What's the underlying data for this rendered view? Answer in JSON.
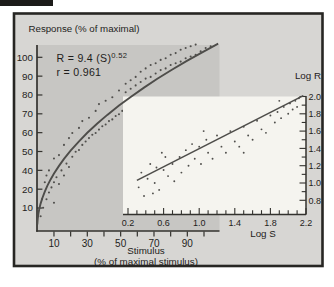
{
  "figure": {
    "title": "Response (% of maximal)",
    "equation_base": "R = 9.4 (S)",
    "equation_exponent": "0.52",
    "correlation": "r = 0.961",
    "xlabel_line1": "Stimulus",
    "xlabel_line2": "(% of maximal stimulus)",
    "inset_xlabel": "Log S",
    "inset_ylabel": "Log R"
  },
  "colors": {
    "page": "#ffffff",
    "frame_fill": "#d7d6d3",
    "frame_stroke": "#272623",
    "plot_area": "#c7c6c3",
    "inset_fill": "#f5f4ef",
    "curve": "#4e4d4a",
    "dot": "#504f4c",
    "axis": "#33322e",
    "text": "#1e1d1b"
  },
  "chart_data": [
    {
      "type": "scatter",
      "name": "main",
      "title": "Response (% of maximal) vs Stimulus (% of maximal stimulus)",
      "xlabel": "Stimulus (% of maximal stimulus)",
      "ylabel": "Response (% of maximal)",
      "xlim": [
        0,
        109
      ],
      "ylim": [
        0,
        109
      ],
      "x_ticks": [
        10,
        20,
        30,
        40,
        50,
        60,
        70,
        80,
        90,
        100
      ],
      "x_tick_labels": [
        "10",
        "30",
        "50",
        "70",
        "90"
      ],
      "x_labeled_values": [
        10,
        30,
        50,
        70,
        90
      ],
      "y_tick_labels": [
        "100",
        "90",
        "80",
        "70",
        "60",
        "50",
        "40",
        "20",
        "10"
      ],
      "grid": false,
      "fit": {
        "type": "power",
        "equation": "R = 9.4 (S)^0.52",
        "a": 9.4,
        "b": 0.52,
        "r": 0.961,
        "s_range": [
          0.02,
          108.5
        ]
      },
      "points": [
        [
          2,
          6
        ],
        [
          2.8,
          16
        ],
        [
          3.5,
          11
        ],
        [
          4.5,
          26
        ],
        [
          5.5,
          16
        ],
        [
          5.5,
          30
        ],
        [
          7,
          20
        ],
        [
          7,
          33
        ],
        [
          8.5,
          23
        ],
        [
          10,
          26
        ],
        [
          10,
          40
        ],
        [
          10,
          14
        ],
        [
          11.5,
          29
        ],
        [
          13,
          42
        ],
        [
          13,
          25
        ],
        [
          14.5,
          33
        ],
        [
          16,
          48
        ],
        [
          16,
          30
        ],
        [
          17.5,
          37
        ],
        [
          19,
          52
        ],
        [
          19,
          35
        ],
        [
          21,
          41
        ],
        [
          21,
          55
        ],
        [
          23,
          44
        ],
        [
          25,
          58
        ],
        [
          25,
          45
        ],
        [
          27,
          48
        ],
        [
          27,
          62
        ],
        [
          29,
          50
        ],
        [
          31,
          64
        ],
        [
          31,
          52
        ],
        [
          33,
          54
        ],
        [
          35,
          68
        ],
        [
          35,
          55
        ],
        [
          37,
          57
        ],
        [
          37,
          72
        ],
        [
          39,
          59
        ],
        [
          41,
          74
        ],
        [
          41,
          60
        ],
        [
          43,
          62
        ],
        [
          45,
          76
        ],
        [
          45,
          63
        ],
        [
          47,
          65
        ],
        [
          49,
          80
        ],
        [
          49,
          66
        ],
        [
          51,
          68
        ],
        [
          53,
          84
        ],
        [
          53,
          79
        ],
        [
          56,
          86
        ],
        [
          56,
          81
        ],
        [
          59,
          88
        ],
        [
          59,
          83
        ],
        [
          62,
          91
        ],
        [
          62,
          85
        ],
        [
          65,
          93
        ],
        [
          65,
          87
        ],
        [
          68,
          95
        ],
        [
          68,
          88
        ],
        [
          71,
          96
        ],
        [
          71,
          90
        ],
        [
          74,
          98
        ],
        [
          74,
          92
        ],
        [
          77,
          99
        ],
        [
          77,
          93
        ],
        [
          80,
          101
        ],
        [
          80,
          95
        ],
        [
          83,
          102
        ],
        [
          83,
          96
        ],
        [
          86,
          104
        ],
        [
          86,
          97
        ],
        [
          89,
          105
        ],
        [
          89,
          99
        ],
        [
          92,
          106
        ],
        [
          92,
          100
        ],
        [
          95,
          107
        ],
        [
          95,
          101
        ],
        [
          98,
          103
        ],
        [
          101,
          105
        ],
        [
          104,
          106
        ]
      ]
    },
    {
      "type": "scatter",
      "name": "inset",
      "title": "Log R vs Log S",
      "xlabel": "Log S",
      "ylabel": "Log R",
      "xlim": [
        0.2,
        2.2
      ],
      "ylim": [
        0.8,
        2.0
      ],
      "x_tick_labels": [
        "0.2",
        "0.6",
        "1.0",
        "1.4",
        "1.8",
        "2.2"
      ],
      "x_labeled_values": [
        0.2,
        0.6,
        1.0,
        1.4,
        1.8,
        2.2
      ],
      "x_minor_step": 0.1,
      "y_tick_labels": [
        "2.0",
        "1.8",
        "1.6",
        "1.4",
        "1.2",
        "1.0",
        "0.8"
      ],
      "y_labeled_values": [
        2.0,
        1.8,
        1.6,
        1.4,
        1.2,
        1.0,
        0.8
      ],
      "y_minor_step": 0.1,
      "grid": false,
      "line": [
        [
          0.3,
          1.03
        ],
        [
          2.17,
          2.01
        ]
      ],
      "points": [
        [
          0.32,
          0.95
        ],
        [
          0.35,
          1.12
        ],
        [
          0.38,
          0.85
        ],
        [
          0.42,
          1.05
        ],
        [
          0.45,
          1.22
        ],
        [
          0.48,
          0.88
        ],
        [
          0.5,
          1.0
        ],
        [
          0.52,
          1.18
        ],
        [
          0.55,
          0.92
        ],
        [
          0.58,
          1.35
        ],
        [
          0.6,
          1.15
        ],
        [
          0.62,
          1.3
        ],
        [
          0.65,
          1.08
        ],
        [
          0.7,
          1.22
        ],
        [
          0.72,
          1.02
        ],
        [
          0.78,
          1.3
        ],
        [
          0.8,
          1.12
        ],
        [
          0.85,
          1.38
        ],
        [
          0.88,
          1.2
        ],
        [
          0.92,
          1.45
        ],
        [
          0.95,
          1.28
        ],
        [
          1.0,
          1.42
        ],
        [
          1.02,
          1.22
        ],
        [
          1.05,
          1.6
        ],
        [
          1.08,
          1.5
        ],
        [
          1.1,
          1.35
        ],
        [
          1.15,
          1.28
        ],
        [
          1.2,
          1.55
        ],
        [
          1.25,
          1.42
        ],
        [
          1.3,
          1.35
        ],
        [
          1.35,
          1.6
        ],
        [
          1.4,
          1.48
        ],
        [
          1.45,
          1.42
        ],
        [
          1.5,
          1.65
        ],
        [
          1.5,
          1.35
        ],
        [
          1.55,
          1.55
        ],
        [
          1.6,
          1.5
        ],
        [
          1.65,
          1.72
        ],
        [
          1.7,
          1.62
        ],
        [
          1.75,
          1.58
        ],
        [
          1.8,
          1.78
        ],
        [
          1.85,
          1.7
        ],
        [
          1.88,
          1.82
        ],
        [
          1.9,
          1.95
        ],
        [
          1.92,
          1.75
        ],
        [
          1.95,
          1.88
        ],
        [
          2.0,
          1.8
        ],
        [
          2.02,
          1.92
        ],
        [
          2.05,
          1.85
        ],
        [
          2.08,
          1.95
        ],
        [
          2.1,
          1.88
        ],
        [
          2.12,
          1.98
        ]
      ]
    }
  ]
}
